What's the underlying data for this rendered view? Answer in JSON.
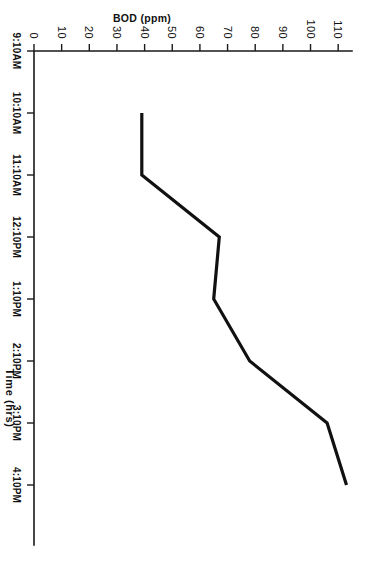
{
  "chart_data": {
    "type": "line",
    "title": "",
    "xlabel": "Time (hrs)",
    "ylabel": "BOD (ppm)",
    "orientation": "page-rotated-90",
    "grid": false,
    "legend": "none",
    "categories": [
      "9:10AM",
      "10:10AM",
      "11:10AM",
      "12:10PM",
      "1:10PM",
      "2:10PM",
      "3:10PM",
      "4:10PM"
    ],
    "x_tick_labels": [
      "9:10AM",
      "10:10AM",
      "11:10AM",
      "12:10PM",
      "1:10PM",
      "2:10PM",
      "3:10PM",
      "4:10PM"
    ],
    "y_tick_labels": [
      "0",
      "10",
      "20",
      "30",
      "40",
      "50",
      "60",
      "70",
      "80",
      "90",
      "100",
      "110"
    ],
    "y_tick_values": [
      0,
      10,
      20,
      30,
      40,
      50,
      60,
      70,
      80,
      90,
      100,
      110
    ],
    "ylim": [
      0,
      115
    ],
    "series": [
      {
        "name": "BOD",
        "x": [
          "10:10AM",
          "11:10AM",
          "12:10PM",
          "1:10PM",
          "2:10PM",
          "3:10PM",
          "4:10PM"
        ],
        "values": [
          39,
          39,
          67,
          65,
          78,
          106,
          113
        ],
        "color": "#111111"
      }
    ]
  },
  "axes": {
    "x_axis": {
      "label": "Time (hrs)",
      "ticks": [
        {
          "label": "9:10AM",
          "value": 0
        },
        {
          "label": "10:10AM",
          "value": 1
        },
        {
          "label": "11:10AM",
          "value": 2
        },
        {
          "label": "12:10PM",
          "value": 3
        },
        {
          "label": "1:10PM",
          "value": 4
        },
        {
          "label": "2:10PM",
          "value": 5
        },
        {
          "label": "3:10PM",
          "value": 6
        },
        {
          "label": "4:10PM",
          "value": 7
        }
      ]
    },
    "y_axis": {
      "label": "BOD (ppm)",
      "ticks": [
        {
          "label": "0",
          "value": 0
        },
        {
          "label": "10",
          "value": 10
        },
        {
          "label": "20",
          "value": 20
        },
        {
          "label": "30",
          "value": 30
        },
        {
          "label": "40",
          "value": 40
        },
        {
          "label": "50",
          "value": 50
        },
        {
          "label": "60",
          "value": 60
        },
        {
          "label": "70",
          "value": 70
        },
        {
          "label": "80",
          "value": 80
        },
        {
          "label": "90",
          "value": 90
        },
        {
          "label": "100",
          "value": 100
        },
        {
          "label": "110",
          "value": 110
        }
      ]
    }
  },
  "colors": {
    "line": "#111111",
    "axis": "#1a1a1a",
    "background": "#ffffff"
  }
}
